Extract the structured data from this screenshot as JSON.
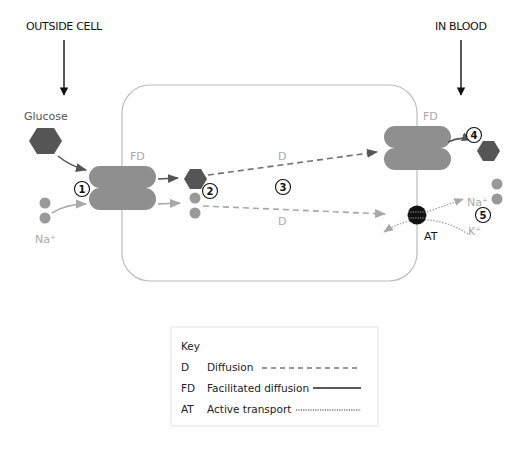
{
  "labels": {
    "outside_cell": "OUTSIDE CELL",
    "in_blood": "IN BLOOD",
    "glucose": "Glucose",
    "na_left": "Na⁺",
    "fd_left": "FD",
    "fd_right": "FD",
    "d_top": "D",
    "d_bottom": "D",
    "at": "AT",
    "na_right": "Na⁺",
    "k_right": "K⁺"
  },
  "steps": [
    "1",
    "2",
    "3",
    "4",
    "5"
  ],
  "key": {
    "title": "Key",
    "items": [
      {
        "abbr": "D",
        "label": "Diffusion",
        "line_style": "dashed"
      },
      {
        "abbr": "FD",
        "label": "Facilitated diffusion",
        "line_style": "solid"
      },
      {
        "abbr": "AT",
        "label": "Active transport",
        "line_style": "dotted"
      }
    ]
  },
  "colors": {
    "glucose": "#555555",
    "sodium": "#999999",
    "protein": "#8f8f8f",
    "membrane": "#bdbdbd",
    "pump": "#111111",
    "arrow_dark": "#5a5a5a",
    "arrow_light": "#a8a8a8"
  }
}
